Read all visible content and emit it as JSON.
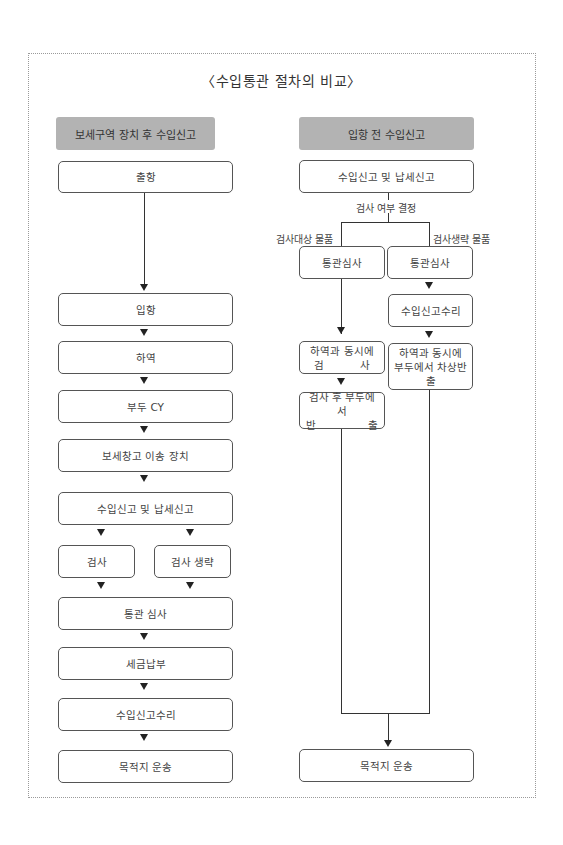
{
  "title": "〈수입통관 절차의 비교〉",
  "left_column": {
    "header": "보세구역 장치 후 수입신고",
    "steps": [
      "출항",
      "입항",
      "하역",
      "부두 CY",
      "보세창고 이송 장치",
      "수입신고 및 납세신고",
      "통관 심사",
      "세금납부",
      "수입신고수리",
      "목적지 운송"
    ],
    "branches": [
      "검사",
      "검사 생략"
    ]
  },
  "right_column": {
    "header": "입항 전 수입신고",
    "first_step": "수입신고 및 납세신고",
    "decision_label": "검사 여부 결정",
    "branch_labels": [
      "검사대상 물품",
      "검사생략 물품"
    ],
    "inspect_path": {
      "review": "통관심사",
      "unload_line1": "하역과 동시에",
      "unload_line2_left": "검",
      "unload_line2_right": "사",
      "release_line1": "검사 후 부두에서",
      "release_line2_left": "반",
      "release_line2_right": "출"
    },
    "skip_path": {
      "review": "통관심사",
      "accept": "수입신고수리",
      "unload_line1": "하역과 동시에",
      "unload_line2": "부두에서 차상반출"
    },
    "final_step": "목적지 운송"
  }
}
